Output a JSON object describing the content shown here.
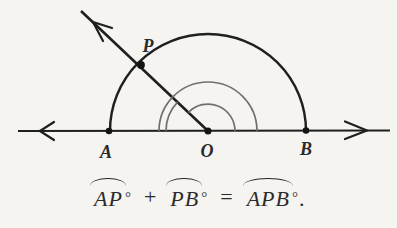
{
  "colors": {
    "ink": "#1f1f1f",
    "arc_gray": "#6f6f6f",
    "paper": "#f5f4f1",
    "label": "#2a2a2a"
  },
  "figure": {
    "points": {
      "a": "A",
      "o": "O",
      "b": "B",
      "p": "P"
    }
  },
  "formula": {
    "term_ap": "AP",
    "term_pb": "PB",
    "term_apb": "APB",
    "degree": "°",
    "plus": "+",
    "equals": "=",
    "period": "."
  }
}
